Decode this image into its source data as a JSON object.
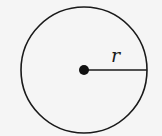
{
  "diagram": {
    "type": "circle-radius",
    "background": "#f5f5f5",
    "stroke_color": "#1a1a1a",
    "circle": {
      "cx": 84,
      "cy": 70,
      "r": 63
    },
    "center_point": {
      "cx": 84,
      "cy": 70,
      "r": 5
    },
    "radius_line": {
      "x1": 84,
      "y1": 70,
      "x2": 147,
      "y2": 70
    },
    "label": {
      "text": "r",
      "x": 111,
      "y": 62
    }
  }
}
